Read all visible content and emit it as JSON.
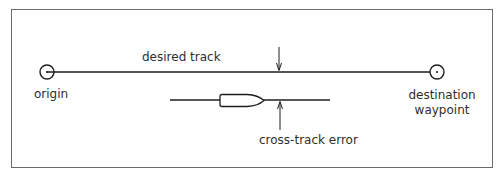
{
  "diagram": {
    "labels": {
      "desired_track": "desired track",
      "origin": "origin",
      "destination_line1": "destination",
      "destination_line2": "waypoint",
      "cross_track_error": "cross-track error"
    },
    "colors": {
      "stroke": "#1e1e1e",
      "border": "#6a6a6a",
      "text": "#2e2e2e",
      "background": "#ffffff"
    },
    "elements": {
      "origin_marker": {
        "cx": 47,
        "cy": 72,
        "r": 7
      },
      "destination_marker": {
        "cx": 437,
        "cy": 72,
        "r": 7
      },
      "desired_track_line": {
        "x1": 47,
        "x2": 437,
        "y": 72
      },
      "actual_track_line": {
        "x1": 170,
        "x2": 330,
        "y": 100
      },
      "boat": {
        "x": 220,
        "y": 94,
        "width": 45,
        "height": 13
      },
      "arrow_down": {
        "x": 279,
        "y1": 47,
        "y2": 71
      },
      "arrow_up": {
        "x": 280,
        "y1": 101,
        "y2": 130
      }
    }
  }
}
